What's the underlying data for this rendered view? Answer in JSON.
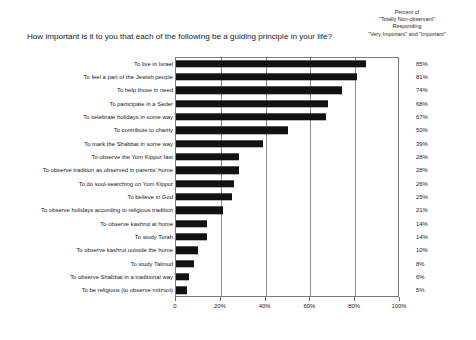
{
  "header": {
    "note_lines": [
      "Percent of",
      "\"Totally Non-observant\"",
      "Responding",
      "\"Very Important\" and \"Important\""
    ]
  },
  "chart_data": {
    "type": "bar",
    "orientation": "horizontal",
    "title": "How important is it to you that each of the following be a guiding principle in your life?",
    "subtitle": "Percent of \"Totally Non-observant\" Responding \"Very Important\" and \"Important\"",
    "xlabel": "",
    "ylabel": "",
    "xlim": [
      0,
      100
    ],
    "grid": true,
    "legend": false,
    "axis_ticks": [
      "0",
      "20%",
      "40%",
      "60%",
      "80%",
      "100%"
    ],
    "axis_tick_values": [
      0,
      20,
      40,
      60,
      80,
      100
    ],
    "bar_color": "#111111",
    "categories": [
      "To live in Israel",
      "To feel a part of the Jewish people",
      "To help those in need",
      "To participate in a  Seder",
      "To celebrate holidays in some way",
      "To contribute to charity",
      "To mark the Shabbat in some way",
      "To observe the Yom Kippur fast",
      "To observe tradition as observed in parents' home",
      "To do soul-searching on Yom Kippur",
      "To believe in God",
      "To observe holidays according to religious tradition",
      "To observe kashrut at home",
      "To study Torah",
      "To observe kashrut outside the home",
      "To study Talmud",
      "To observe Shabbat in a traditional way",
      "To be religious (to observe mitzvot)"
    ],
    "values": [
      85,
      81,
      74,
      68,
      67,
      50,
      39,
      28,
      28,
      26,
      25,
      21,
      14,
      14,
      10,
      8,
      6,
      5
    ],
    "value_labels": [
      "85%",
      "81%",
      "74%",
      "68%",
      "67%",
      "50%",
      "39%",
      "28%",
      "28%",
      "26%",
      "25%",
      "21%",
      "14%",
      "14%",
      "10%",
      "8%",
      "6%",
      "5%"
    ]
  }
}
